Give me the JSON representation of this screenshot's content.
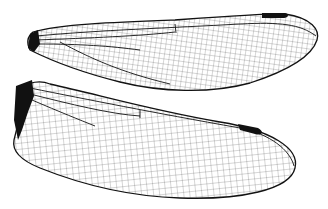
{
  "image": {
    "subject": "dragonfly wings line drawing",
    "wings": [
      {
        "name": "forewing",
        "position": "top"
      },
      {
        "name": "hindwing",
        "position": "bottom"
      }
    ],
    "colors": {
      "background": "#ffffff",
      "vein": "#111111"
    }
  }
}
